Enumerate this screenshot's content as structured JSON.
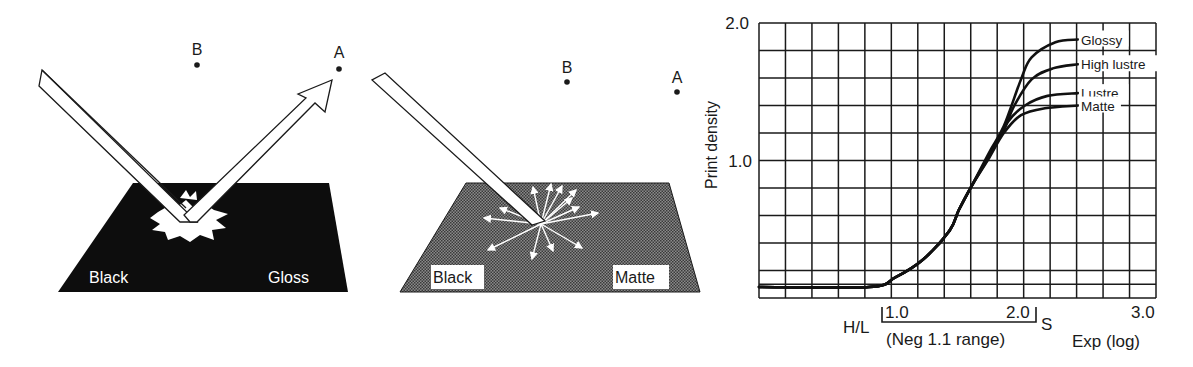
{
  "illustrations": [
    {
      "id": "gloss",
      "surface_color": "#0d0d0d",
      "labels": {
        "left": "Black",
        "right": "Gloss",
        "point_a": "A",
        "point_b": "B"
      },
      "description": "Incident beam reflected specularly toward point A"
    },
    {
      "id": "matte",
      "surface_color": "#6e6e6e",
      "labels": {
        "left": "Black",
        "right": "Matte",
        "point_a": "A",
        "point_b": "B"
      },
      "description": "Incident beam scattered diffusely in all directions"
    }
  ],
  "chart_data": {
    "type": "line",
    "title": "",
    "xlabel": "Exp (log)",
    "ylabel": "Print density",
    "xlim": [
      0,
      3.0
    ],
    "ylim": [
      0,
      2.0
    ],
    "grid": true,
    "x_grid_step": 0.2,
    "y_grid_step": 0.2,
    "x_tick_labels": [
      {
        "value": 1.0,
        "label": "1.0"
      },
      {
        "value": 2.0,
        "label": "2.0"
      },
      {
        "value": 3.0,
        "label": "3.0"
      }
    ],
    "y_tick_labels": [
      {
        "value": 1.0,
        "label": "1.0"
      },
      {
        "value": 2.0,
        "label": "2.0"
      }
    ],
    "legend_position": "inline-right",
    "annotations": {
      "hl_label": "H/L",
      "s_label": "S",
      "range_label": "(Neg 1.1 range)",
      "bracket_start": 0.95,
      "bracket_end": 2.1
    },
    "shared_toe": {
      "x": [
        0.0,
        0.83,
        1.03,
        1.24,
        1.44,
        1.51,
        1.61
      ],
      "y": [
        0.08,
        0.08,
        0.15,
        0.28,
        0.49,
        0.64,
        0.82
      ]
    },
    "series": [
      {
        "name": "Glossy",
        "x": [
          1.61,
          1.74,
          1.85,
          1.98,
          2.06,
          2.24,
          2.41
        ],
        "y": [
          0.82,
          1.06,
          1.25,
          1.59,
          1.75,
          1.86,
          1.88
        ]
      },
      {
        "name": "High lustre",
        "x": [
          1.61,
          1.74,
          1.85,
          1.93,
          2.06,
          2.22,
          2.41
        ],
        "y": [
          0.82,
          1.04,
          1.22,
          1.4,
          1.59,
          1.67,
          1.7
        ]
      },
      {
        "name": "Lustre",
        "x": [
          1.61,
          1.74,
          1.88,
          2.01,
          2.18,
          2.41
        ],
        "y": [
          0.82,
          1.03,
          1.28,
          1.4,
          1.47,
          1.49
        ]
      },
      {
        "name": "Matte",
        "x": [
          1.61,
          1.74,
          1.85,
          1.98,
          2.16,
          2.41
        ],
        "y": [
          0.82,
          1.02,
          1.2,
          1.33,
          1.38,
          1.4
        ]
      }
    ]
  }
}
